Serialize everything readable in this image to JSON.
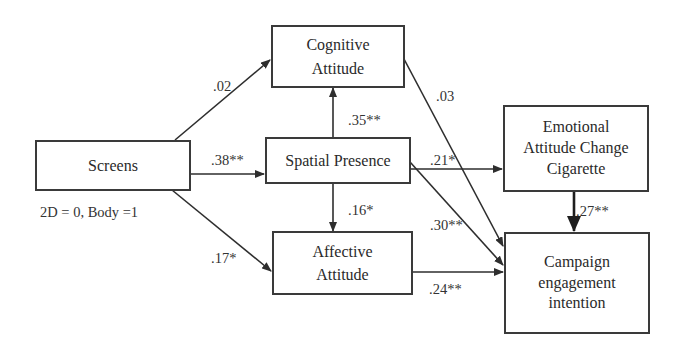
{
  "nodes": {
    "screens": {
      "line1": "Screens"
    },
    "screens_note": "2D = 0, Body =1",
    "cognitive": {
      "line1": "Cognitive",
      "line2": "Attitude"
    },
    "spatial": {
      "line1": "Spatial Presence"
    },
    "affective": {
      "line1": "Affective",
      "line2": "Attitude"
    },
    "emotional": {
      "line1": "Emotional",
      "line2": "Attitude Change",
      "line3": "Cigarette"
    },
    "campaign": {
      "line1": "Campaign",
      "line2": "engagement",
      "line3": "intention"
    }
  },
  "paths": [
    {
      "from": "Screens",
      "to": "Cognitive Attitude",
      "coef": ".02"
    },
    {
      "from": "Screens",
      "to": "Spatial Presence",
      "coef": ".38**"
    },
    {
      "from": "Screens",
      "to": "Affective Attitude",
      "coef": ".17*"
    },
    {
      "from": "Spatial Presence",
      "to": "Cognitive Attitude",
      "coef": ".35**"
    },
    {
      "from": "Spatial Presence",
      "to": "Affective Attitude",
      "coef": ".16*"
    },
    {
      "from": "Spatial Presence",
      "to": "Emotional Attitude Change Cigarette",
      "coef": ".21*"
    },
    {
      "from": "Spatial Presence",
      "to": "Campaign engagement intention",
      "coef": ".30**"
    },
    {
      "from": "Cognitive Attitude",
      "to": "Campaign engagement intention",
      "coef": ".03"
    },
    {
      "from": "Affective Attitude",
      "to": "Campaign engagement intention",
      "coef": ".24**"
    },
    {
      "from": "Emotional Attitude Change Cigarette",
      "to": "Campaign engagement intention",
      "coef": ".27**"
    }
  ],
  "colors": {
    "line": "#2e2e2e",
    "text": "#2a2a2a",
    "background": "#ffffff"
  }
}
